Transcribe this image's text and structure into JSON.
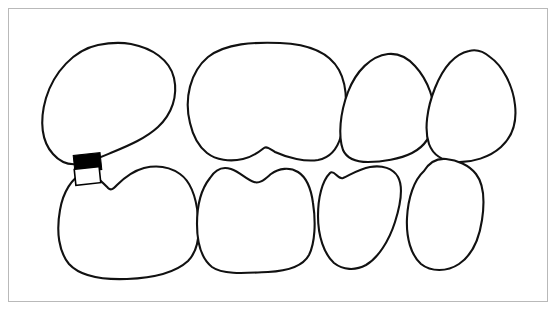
{
  "figure": {
    "title": "Dental arch line diagram",
    "description": "Line drawing of four upper teeth and four lower teeth in occlusion, with a rectangular annotation marker at the left contact area.",
    "background_color": "#ffffff",
    "frame_color": "#b9b9b9",
    "outline_color": "#111111",
    "outline_width_px": 2.1,
    "width_px": 557,
    "height_px": 310
  },
  "frame": {
    "name": "diagram-border",
    "left_px": 8,
    "top_px": 8,
    "width_px": 540,
    "height_px": 294,
    "style": "thin light gray rectangle"
  },
  "arches": [
    {
      "id": "upper-arch",
      "label": "Upper arch",
      "position": "top",
      "tooth_count": 4,
      "teeth": [
        {
          "id": "upper-tooth-1",
          "label": "Upper tooth 1",
          "type": "central incisor",
          "shape": "large rounded quadrilateral",
          "bbox_px": [
            42,
            42,
            175,
            168
          ],
          "notes": "widest upper tooth, apex rounded top-left, lower-right edge curves toward contact"
        },
        {
          "id": "upper-tooth-2",
          "label": "Upper tooth 2",
          "type": "central incisor",
          "shape": "broad rounded square with basal notch",
          "bbox_px": [
            182,
            43,
            345,
            162
          ],
          "notes": "flat-topped dome, V notch in lower border near center"
        },
        {
          "id": "upper-tooth-3",
          "label": "Upper tooth 3",
          "type": "lateral incisor",
          "shape": "narrow ovoid",
          "bbox_px": [
            338,
            53,
            436,
            162
          ],
          "notes": "tapered rounded apex, narrower than centrals"
        },
        {
          "id": "upper-tooth-4",
          "label": "Upper tooth 4",
          "type": "lateral incisor",
          "shape": "rounded triangular ovoid",
          "bbox_px": [
            424,
            50,
            517,
            162
          ],
          "notes": "apex tilted to the left, broad rounded base"
        }
      ]
    },
    {
      "id": "lower-arch",
      "label": "Lower arch",
      "position": "bottom",
      "tooth_count": 4,
      "teeth": [
        {
          "id": "lower-tooth-1",
          "label": "Lower tooth 1",
          "type": "central incisor",
          "shape": "large rounded square",
          "bbox_px": [
            57,
            167,
            200,
            279
          ],
          "notes": "upper border rises to a cusp near the annotation marker"
        },
        {
          "id": "lower-tooth-2",
          "label": "Lower tooth 2",
          "type": "central incisor",
          "shape": "broad rounded square with wavy crest",
          "bbox_px": [
            195,
            164,
            315,
            272
          ],
          "notes": "undulating occlusal crest with central dip"
        },
        {
          "id": "lower-tooth-3",
          "label": "Lower tooth 3",
          "type": "lateral incisor",
          "shape": "tapering ovoid",
          "bbox_px": [
            316,
            162,
            407,
            270
          ],
          "notes": "narrows toward rounded bottom"
        },
        {
          "id": "lower-tooth-4",
          "label": "Lower tooth 4",
          "type": "lateral incisor",
          "shape": "rounded rectangle",
          "bbox_px": [
            403,
            155,
            487,
            270
          ],
          "notes": "broad squared crown, rounded base"
        }
      ]
    }
  ],
  "annotations": [
    {
      "id": "marker-filled",
      "name": "annotation-marker-filled",
      "style": "solid black rectangle",
      "fill_color": "#000000",
      "stroke_color": "#000000",
      "bbox_px": [
        74,
        154,
        101,
        171
      ],
      "rotation_deg": -6,
      "notes": "placed over the contact point between upper tooth 1 and lower tooth 1"
    },
    {
      "id": "marker-open",
      "name": "annotation-marker-outline",
      "style": "white rectangle with black outline",
      "fill_color": "#ffffff",
      "stroke_color": "#000000",
      "bbox_px": [
        74,
        168,
        99,
        184
      ],
      "rotation_deg": -6,
      "notes": "directly below the filled marker, same contact region"
    }
  ],
  "contacts": [
    {
      "id": "contact-upper-1-2",
      "label": "Contact between upper tooth 1 and upper tooth 2",
      "point_px": [
        188,
        145
      ]
    },
    {
      "id": "contact-upper-2-3",
      "label": "Contact between upper tooth 2 and upper tooth 3",
      "point_px": [
        343,
        140
      ]
    },
    {
      "id": "contact-upper-3-4",
      "label": "Contact between upper tooth 3 and upper tooth 4",
      "point_px": [
        430,
        150
      ]
    },
    {
      "id": "contact-lower-1-2",
      "label": "Contact between lower tooth 1 and lower tooth 2",
      "point_px": [
        197,
        215
      ]
    },
    {
      "id": "contact-lower-2-3",
      "label": "Contact between lower tooth 2 and lower tooth 3",
      "point_px": [
        316,
        205
      ]
    },
    {
      "id": "contact-lower-3-4",
      "label": "Contact between lower tooth 3 and lower tooth 4",
      "point_px": [
        405,
        195
      ]
    }
  ]
}
